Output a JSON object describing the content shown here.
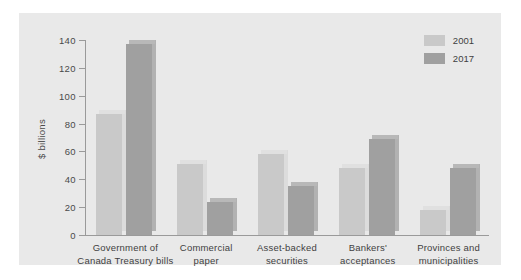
{
  "chart_data": {
    "type": "bar",
    "title": "",
    "xlabel": "",
    "ylabel": "$ billions",
    "ylim": [
      0,
      140
    ],
    "yticks": [
      0,
      20,
      40,
      60,
      80,
      100,
      120,
      140
    ],
    "grid": false,
    "legend_position": "top-right",
    "categories": [
      "Government of\nCanada Treasury bills",
      "Commercial\npaper",
      "Asset-backed\nsecurities",
      "Bankers'\nacceptances",
      "Provinces and\nmunicipalities"
    ],
    "category_lines": [
      [
        "Government of",
        "Canada Treasury bills"
      ],
      [
        "Commercial",
        "paper"
      ],
      [
        "Asset-backed",
        "securities"
      ],
      [
        "Bankers'",
        "acceptances"
      ],
      [
        "Provinces and",
        "municipalities"
      ]
    ],
    "series": [
      {
        "name": "2001",
        "color": "#c9c9c9",
        "values": [
          87,
          51,
          58,
          48,
          18
        ]
      },
      {
        "name": "2017",
        "color": "#a0a0a0",
        "values": [
          137,
          24,
          35,
          69,
          48
        ]
      }
    ]
  },
  "legend": {
    "items": [
      {
        "label": "2001"
      },
      {
        "label": "2017"
      }
    ]
  },
  "axis": {
    "y_label": "$ billions",
    "y_ticks": [
      "0",
      "20",
      "40",
      "60",
      "80",
      "100",
      "120",
      "140"
    ]
  }
}
